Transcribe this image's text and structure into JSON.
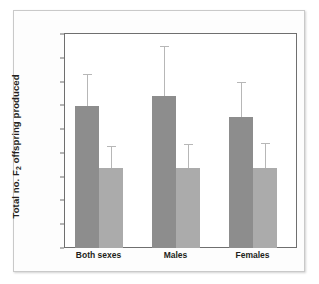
{
  "figure": {
    "background_color": "#ffffff",
    "frame_color": "#6f6f6f",
    "outer_border_color": "#c9c9c9"
  },
  "chart_data": {
    "type": "bar",
    "title": "",
    "xlabel": "",
    "ylabel": "Total no. F2 offspring produced",
    "ylabel_parts": {
      "before": "Total no. F",
      "subscript": "2",
      "after": " offspring produced"
    },
    "categories": [
      "Both sexes",
      "Males",
      "Females"
    ],
    "ylim": [
      0,
      4.5
    ],
    "ytick_step": 0.5,
    "yticks": [
      0,
      0.5,
      1.0,
      1.5,
      2.0,
      2.5,
      3.0,
      3.5,
      4.0,
      4.5
    ],
    "ytick_labels": [
      "0",
      "0.5",
      "1.0",
      "1.5",
      "2.0",
      "2.5",
      "3.0",
      "3.5",
      "4.0",
      "4.5"
    ],
    "grid": false,
    "legend": "none",
    "error_bar_style": "upper-only-with-cap",
    "series": [
      {
        "name": "dark",
        "color": "#8d8d8d",
        "values": [
          2.98,
          3.19,
          2.75
        ],
        "error_upper": [
          0.67,
          1.06,
          0.75
        ],
        "error_top_values": [
          3.65,
          4.25,
          3.5
        ]
      },
      {
        "name": "light",
        "color": "#ababab",
        "values": [
          1.68,
          1.68,
          1.68
        ],
        "error_upper": [
          0.47,
          0.5,
          0.52
        ],
        "error_top_values": [
          2.15,
          2.18,
          2.2
        ]
      }
    ]
  }
}
